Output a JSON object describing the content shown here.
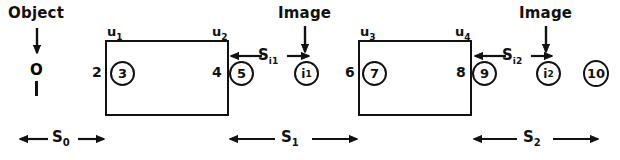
{
  "diagram": {
    "stroke_color": "#111111",
    "background_color": "#ffffff",
    "annotations": {
      "object_label": "Object",
      "image_label_1": "Image",
      "image_label_2": "Image",
      "object_point": "O",
      "object_bar": "1"
    },
    "surfaces": [
      {
        "name": "u1",
        "text": "u",
        "sub": "1"
      },
      {
        "name": "u2",
        "text": "u",
        "sub": "2"
      },
      {
        "name": "u3",
        "text": "u",
        "sub": "3"
      },
      {
        "name": "u4",
        "text": "u",
        "sub": "4"
      }
    ],
    "plain_numbers": [
      {
        "name": "node-2",
        "value": "2"
      },
      {
        "name": "node-4",
        "value": "4"
      },
      {
        "name": "node-6",
        "value": "6"
      },
      {
        "name": "node-8",
        "value": "8"
      }
    ],
    "circled_nodes": [
      {
        "name": "circled-3",
        "value": "3"
      },
      {
        "name": "circled-5",
        "value": "5"
      },
      {
        "name": "circled-i1",
        "text": "i",
        "sub": "1"
      },
      {
        "name": "circled-7",
        "value": "7"
      },
      {
        "name": "circled-9",
        "value": "9"
      },
      {
        "name": "circled-i2",
        "text": "i",
        "sub": "2"
      },
      {
        "name": "circled-10",
        "value": "10"
      }
    ],
    "distances": [
      {
        "name": "S0",
        "text": "S",
        "sub": "0"
      },
      {
        "name": "Si1",
        "text": "S",
        "sub": "i1"
      },
      {
        "name": "S1",
        "text": "S",
        "sub": "1"
      },
      {
        "name": "Si2",
        "text": "S",
        "sub": "i2"
      },
      {
        "name": "S2",
        "text": "S",
        "sub": "2"
      }
    ]
  }
}
